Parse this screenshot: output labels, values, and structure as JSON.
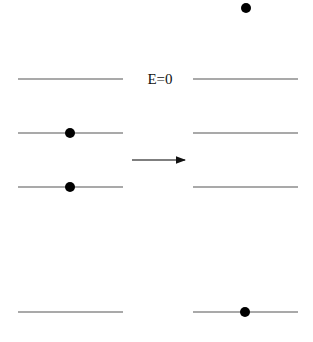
{
  "diagram": {
    "label": "E=0",
    "label_pos": [
      160,
      79
    ],
    "line_color": "#555555",
    "dot_color": "#000000",
    "left_levels": [
      {
        "y": 79,
        "x1": 18,
        "x2": 123,
        "dot_x": null
      },
      {
        "y": 133,
        "x1": 18,
        "x2": 123,
        "dot_x": 70
      },
      {
        "y": 187,
        "x1": 18,
        "x2": 123,
        "dot_x": 70
      },
      {
        "y": 312,
        "x1": 18,
        "x2": 123,
        "dot_x": null
      }
    ],
    "right_levels": [
      {
        "y": 79,
        "x1": 193,
        "x2": 298,
        "dot_x": null
      },
      {
        "y": 133,
        "x1": 193,
        "x2": 298,
        "dot_x": null
      },
      {
        "y": 187,
        "x1": 193,
        "x2": 298,
        "dot_x": null
      },
      {
        "y": 312,
        "x1": 193,
        "x2": 298,
        "dot_x": 245
      }
    ],
    "free_particle": {
      "x": 246,
      "y": 8
    },
    "arrow": {
      "x1": 132,
      "x2": 185,
      "y": 160
    }
  }
}
